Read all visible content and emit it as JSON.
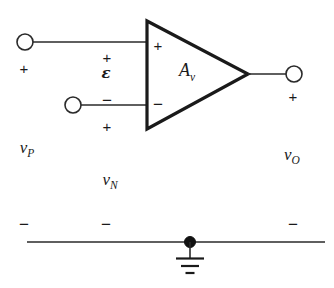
{
  "figure": {
    "type": "circuit-schematic",
    "line_color": "#1a1a1a",
    "background_color": "#ffffff"
  },
  "amplifier": {
    "gain_label": "A",
    "gain_subscript": "v",
    "input_plus_sign": "+",
    "input_minus_sign": "−"
  },
  "terminals": {
    "noninverting_input": {
      "voltage_label": "v",
      "voltage_subscript": "P",
      "polarity_top": "+",
      "polarity_bottom": "−"
    },
    "inverting_input": {
      "voltage_label": "v",
      "voltage_subscript": "N",
      "polarity_top": "+",
      "polarity_bottom": "−"
    },
    "output": {
      "voltage_label": "v",
      "voltage_subscript": "O",
      "polarity_top": "+",
      "polarity_bottom": "−"
    }
  },
  "differential": {
    "symbol": "ε",
    "polarity_top": "+",
    "polarity_bottom": "−"
  },
  "ground": {
    "symbol_name": "earth-ground"
  }
}
